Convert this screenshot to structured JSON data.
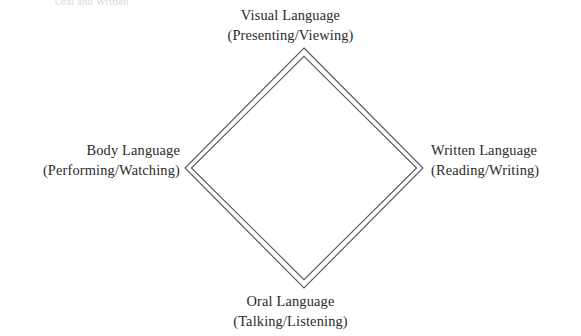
{
  "figure": {
    "type": "diamond-diagram",
    "clipped_header_text": "Oral and Written",
    "background_color": "#ffffff",
    "stroke_color": "#5a5a5a",
    "text_color": "#2a2a2a",
    "nodes": [
      {
        "id": "visual",
        "position": "top",
        "title": "Visual Language",
        "subtitle": "(Presenting/Viewing)"
      },
      {
        "id": "written",
        "position": "right",
        "title": "Written Language",
        "subtitle": "(Reading/Writing)"
      },
      {
        "id": "oral",
        "position": "bottom",
        "title": "Oral Language",
        "subtitle": "(Talking/Listening)"
      },
      {
        "id": "body",
        "position": "left",
        "title": "Body Language",
        "subtitle": "(Performing/Watching)"
      }
    ],
    "geometry": {
      "top_vertex": "304,48",
      "right_vertex": "423,168",
      "bottom_vertex": "304,288",
      "left_vertex": "185,168",
      "inner_top_vertex": "304,56",
      "inner_right_vertex": "417,168",
      "inner_bottom_vertex": "304,280",
      "inner_left_vertex": "191,168"
    }
  }
}
